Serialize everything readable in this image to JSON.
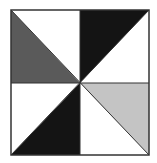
{
  "diagram": {
    "type": "pinwheel-quilt-block",
    "square": {
      "x": 11,
      "y": 10,
      "width": 138,
      "height": 145
    },
    "center": {
      "x": 80,
      "y": 83
    },
    "colors": {
      "background": "#ffffff",
      "outline": "#333333",
      "dark_gray": "#5a5a5a",
      "black": "#141414",
      "light_gray": "#c4c4c4",
      "white": "#ffffff"
    },
    "quadrants": [
      {
        "name": "top-left",
        "shaded_triangle": "lower-left",
        "fill": "dark_gray"
      },
      {
        "name": "top-right",
        "shaded_triangle": "upper-left",
        "fill": "black"
      },
      {
        "name": "bottom-left",
        "shaded_triangle": "lower-right",
        "fill": "black"
      },
      {
        "name": "bottom-right",
        "shaded_triangle": "upper-right",
        "fill": "light_gray"
      }
    ]
  }
}
